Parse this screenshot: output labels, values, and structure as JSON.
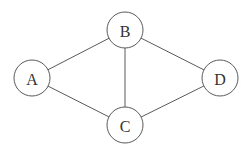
{
  "diagram": {
    "type": "undirected-graph",
    "colors": {
      "background": "#ffffff",
      "stroke": "#5a5a5a",
      "label": "#333333",
      "node_fill": "#ffffff"
    },
    "node_radius": 18,
    "nodes": [
      {
        "id": "A",
        "label": "A",
        "cx": 32,
        "cy": 78
      },
      {
        "id": "B",
        "label": "B",
        "cx": 125,
        "cy": 30
      },
      {
        "id": "C",
        "label": "C",
        "cx": 125,
        "cy": 125
      },
      {
        "id": "D",
        "label": "D",
        "cx": 220,
        "cy": 78
      }
    ],
    "edges": [
      {
        "from": "A",
        "to": "B"
      },
      {
        "from": "A",
        "to": "C"
      },
      {
        "from": "B",
        "to": "C"
      },
      {
        "from": "B",
        "to": "D"
      },
      {
        "from": "C",
        "to": "D"
      }
    ]
  }
}
